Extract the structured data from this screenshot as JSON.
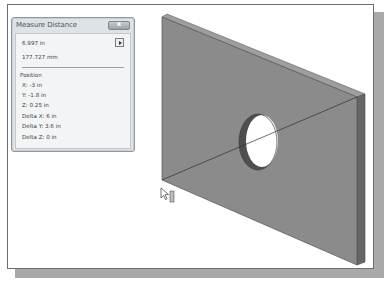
{
  "dialog": {
    "title": "Measure Distance",
    "close_label": "x",
    "distance_in": "6.997 in",
    "distance_mm": "177.727 mm",
    "position_header": "Position",
    "rows": [
      {
        "label": "X: -3 in"
      },
      {
        "label": "Y: -1.8 in"
      },
      {
        "label": "Z: 0.25 in"
      },
      {
        "label": "Delta X: 6 in"
      },
      {
        "label": "Delta Y: 3.6 in"
      },
      {
        "label": "Delta Z: 0 in"
      }
    ]
  },
  "model": {
    "description": "Rectangular plate with circular hole, isometric view",
    "colors": {
      "face": "#8a8a8a",
      "side": "#6a6a6a",
      "top_edge": "#9c9c9c",
      "hole_inner": "#5a5a5a",
      "measure_line": "#3a3a3a"
    }
  }
}
